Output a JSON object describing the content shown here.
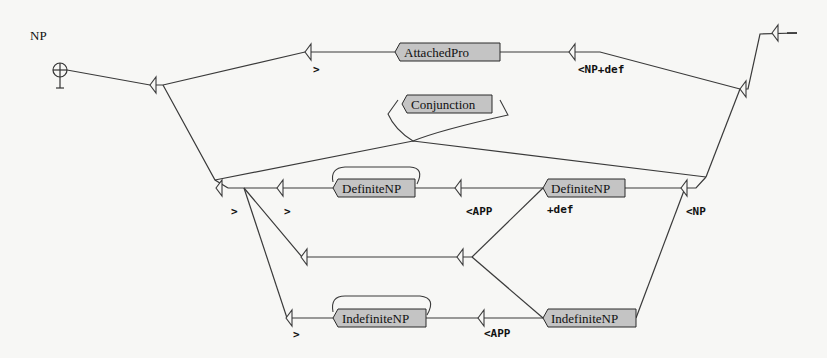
{
  "graph": {
    "title": "NP",
    "start_icon": "initial-state-icon",
    "final_icon": "final-state-icon",
    "nodes": [
      {
        "id": "attachedpro",
        "label": "AttachedPro",
        "output": "<NP+def"
      },
      {
        "id": "conjunction",
        "label": "Conjunction",
        "output": ""
      },
      {
        "id": "definitenp1",
        "label": "DefiniteNP",
        "output": "<APP"
      },
      {
        "id": "definitenp2",
        "label": "DefiniteNP",
        "output": "+def"
      },
      {
        "id": "indefinitenp1",
        "label": "IndefiniteNP",
        "output": "<APP"
      },
      {
        "id": "indefinitenp2",
        "label": "IndefiniteNP",
        "output": ""
      }
    ],
    "outputs": {
      "gt_top": ">",
      "np_def": "<NP+def",
      "gt_mid1": ">",
      "gt_mid2": ">",
      "app_mid": "<APP",
      "def": "+def",
      "np": "<NP",
      "gt_bot": ">",
      "app_bot": "<APP"
    }
  }
}
